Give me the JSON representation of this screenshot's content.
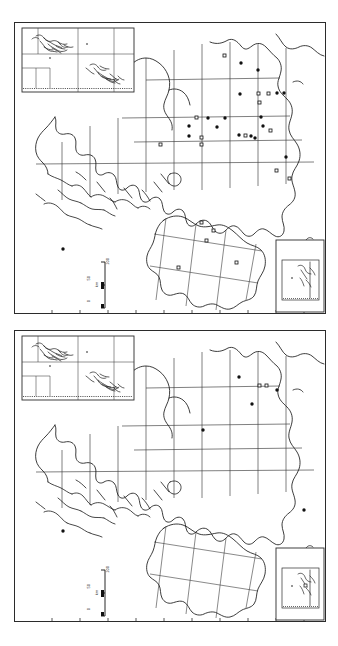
{
  "figure": {
    "type": "distribution-map-pair",
    "orientation": "vertical-stack",
    "background_color": "#ffffff",
    "line_color": "#2b2b2b",
    "panel_count": 2
  },
  "panels": [
    {
      "id": "upper-map",
      "name": "Upper distribution map",
      "scalebar": {
        "unit": "km",
        "ticks": [
          "0",
          "50",
          "100"
        ],
        "label_0": "0",
        "label_50": "50",
        "label_100": "100"
      },
      "insets": [
        {
          "id": "upper-inset-northwest",
          "position": "top-left"
        },
        {
          "id": "upper-inset-southeast",
          "position": "bottom-right"
        }
      ],
      "symbols": {
        "filled": "filled-circle",
        "open": "open-square",
        "filled_count": 24,
        "open_count": 26
      },
      "points": [
        {
          "x": 0.676,
          "y": 0.115,
          "t": "o"
        },
        {
          "x": 0.728,
          "y": 0.139,
          "t": "f"
        },
        {
          "x": 0.782,
          "y": 0.163,
          "t": "f"
        },
        {
          "x": 0.723,
          "y": 0.247,
          "t": "f"
        },
        {
          "x": 0.784,
          "y": 0.245,
          "t": "o"
        },
        {
          "x": 0.816,
          "y": 0.245,
          "t": "o"
        },
        {
          "x": 0.843,
          "y": 0.243,
          "t": "f"
        },
        {
          "x": 0.866,
          "y": 0.243,
          "t": "f"
        },
        {
          "x": 0.788,
          "y": 0.272,
          "t": "o"
        },
        {
          "x": 0.585,
          "y": 0.328,
          "t": "o"
        },
        {
          "x": 0.622,
          "y": 0.341,
          "t": "f"
        },
        {
          "x": 0.677,
          "y": 0.33,
          "t": "f"
        },
        {
          "x": 0.7,
          "y": 0.329,
          "t": "f"
        },
        {
          "x": 0.792,
          "y": 0.326,
          "t": "f"
        },
        {
          "x": 0.562,
          "y": 0.356,
          "t": "f"
        },
        {
          "x": 0.652,
          "y": 0.359,
          "t": "f"
        },
        {
          "x": 0.8,
          "y": 0.356,
          "t": "f"
        },
        {
          "x": 0.822,
          "y": 0.37,
          "t": "o"
        },
        {
          "x": 0.56,
          "y": 0.392,
          "t": "f"
        },
        {
          "x": 0.6,
          "y": 0.397,
          "t": "o"
        },
        {
          "x": 0.723,
          "y": 0.389,
          "t": "f"
        },
        {
          "x": 0.741,
          "y": 0.389,
          "t": "o"
        },
        {
          "x": 0.76,
          "y": 0.391,
          "t": "f"
        },
        {
          "x": 0.774,
          "y": 0.398,
          "t": "f"
        },
        {
          "x": 0.47,
          "y": 0.418,
          "t": "o"
        },
        {
          "x": 0.601,
          "y": 0.418,
          "t": "o"
        },
        {
          "x": 0.872,
          "y": 0.462,
          "t": "f"
        },
        {
          "x": 0.84,
          "y": 0.508,
          "t": "o"
        },
        {
          "x": 0.882,
          "y": 0.534,
          "t": "o"
        },
        {
          "x": 0.158,
          "y": 0.779,
          "t": "f"
        },
        {
          "x": 0.601,
          "y": 0.685,
          "t": "o"
        },
        {
          "x": 0.64,
          "y": 0.712,
          "t": "o"
        },
        {
          "x": 0.617,
          "y": 0.748,
          "t": "o"
        },
        {
          "x": 0.712,
          "y": 0.823,
          "t": "o"
        },
        {
          "x": 0.527,
          "y": 0.838,
          "t": "o"
        }
      ]
    },
    {
      "id": "lower-map",
      "name": "Lower distribution map",
      "scalebar": {
        "unit": "km",
        "ticks": [
          "0",
          "50",
          "100"
        ],
        "label_0": "0",
        "label_50": "50",
        "label_100": "100"
      },
      "insets": [
        {
          "id": "lower-inset-northwest",
          "position": "top-left"
        },
        {
          "id": "lower-inset-southeast",
          "position": "bottom-right"
        }
      ],
      "symbols": {
        "filled": "filled-circle",
        "open": "open-square",
        "filled_count": 5,
        "open_count": 4
      },
      "points": [
        {
          "x": 0.721,
          "y": 0.162,
          "t": "f"
        },
        {
          "x": 0.787,
          "y": 0.192,
          "t": "o"
        },
        {
          "x": 0.809,
          "y": 0.193,
          "t": "o"
        },
        {
          "x": 0.843,
          "y": 0.208,
          "t": "f"
        },
        {
          "x": 0.763,
          "y": 0.254,
          "t": "f"
        },
        {
          "x": 0.605,
          "y": 0.343,
          "t": "f"
        },
        {
          "x": 0.158,
          "y": 0.688,
          "t": "f"
        },
        {
          "x": 0.93,
          "y": 0.619,
          "t": "f"
        }
      ]
    }
  ]
}
